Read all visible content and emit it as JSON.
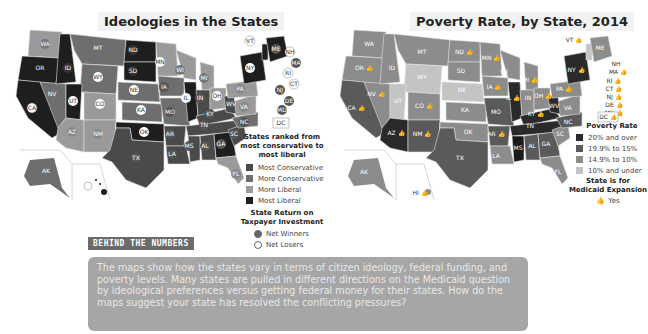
{
  "left_map": {
    "title": "Ideologies in the States",
    "legend_title": "States ranked from most conservative to most liberal",
    "legend_items": [
      {
        "label": "Most Conservative",
        "color": "#4a4a4a"
      },
      {
        "label": "More Conservative",
        "color": "#6e6e6e"
      },
      {
        "label": "More Liberal",
        "color": "#9a9a9a"
      },
      {
        "label": "Most Liberal",
        "color": "#1e1e1e"
      }
    ],
    "legend2_title": "State Return on Taxpayer Investment",
    "legend2_items": [
      {
        "label": "Net Winners",
        "style": "filled"
      },
      {
        "label": "Net Losers",
        "style": "hollow"
      }
    ],
    "state_labels": [
      "WA",
      "OR",
      "CA",
      "NV",
      "ID",
      "MT",
      "WY",
      "UT",
      "AZ",
      "CO",
      "NM",
      "ND",
      "SD",
      "NE",
      "KS",
      "OK",
      "TX",
      "MN",
      "IA",
      "MO",
      "AR",
      "LA",
      "WI",
      "IL",
      "MI",
      "IN",
      "OH",
      "KY",
      "TN",
      "MS",
      "AL",
      "GA",
      "FL",
      "SC",
      "NC",
      "VA",
      "WV",
      "PA",
      "NY",
      "VT",
      "ME",
      "NH",
      "MA",
      "RI",
      "CT",
      "NJ",
      "DE",
      "MD",
      "DC",
      "AK",
      "HI"
    ]
  },
  "right_map": {
    "title": "Poverty Rate, by State, 2014",
    "legend_title": "Poverty Rate",
    "legend_items": [
      {
        "label": "20% and over",
        "color": "#2a2a2a"
      },
      {
        "label": "19.9% to 15%",
        "color": "#5a5a5a"
      },
      {
        "label": "14.9% to 10%",
        "color": "#8c8c8c"
      },
      {
        "label": "10% and under",
        "color": "#c4c4c4"
      }
    ],
    "legend2_title": "State is for Medicaid Expansion",
    "legend2_items": [
      {
        "label": "Yes",
        "icon": "thumbs-up-icon"
      }
    ],
    "state_labels": [
      "WA",
      "OR",
      "CA",
      "NV",
      "ID",
      "MT",
      "WY",
      "UT",
      "AZ",
      "CO",
      "NM",
      "ND",
      "SD",
      "NE",
      "KS",
      "OK",
      "TX",
      "MN",
      "IA",
      "MO",
      "AR",
      "LA",
      "WI",
      "IL",
      "MI",
      "IN",
      "OH",
      "KY",
      "TN",
      "MS",
      "AL",
      "GA",
      "FL",
      "SC",
      "NC",
      "VA",
      "WV",
      "PA",
      "NY",
      "VT",
      "ME",
      "NH",
      "MA",
      "RI",
      "CT",
      "NJ",
      "DE",
      "MD",
      "DC",
      "AK",
      "HI"
    ]
  },
  "behind_the_numbers": {
    "heading": "BEHIND THE NUMBERS",
    "text": "The maps show how the states vary in terms of citizen ideology, federal funding, and poverty levels. Many states are pulled in different directions on the Medicaid question by ideological preferences versus getting federal money for their states. How do the maps suggest your state has resolved the conflicting pressures?"
  }
}
